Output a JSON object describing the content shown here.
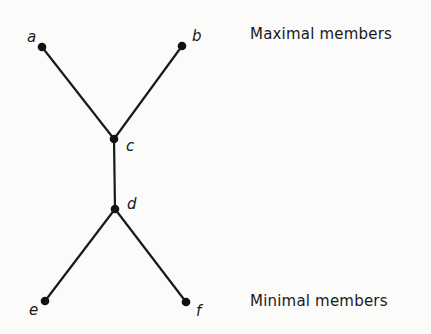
{
  "diagram": {
    "type": "hasse-diagram",
    "nodes": [
      {
        "id": "a",
        "label": "a",
        "x": 42,
        "y": 47,
        "lx": 27,
        "ly": 42
      },
      {
        "id": "b",
        "label": "b",
        "x": 182,
        "y": 46,
        "lx": 192,
        "ly": 41
      },
      {
        "id": "c",
        "label": "c",
        "x": 114,
        "y": 139,
        "lx": 126,
        "ly": 151
      },
      {
        "id": "d",
        "label": "d",
        "x": 115,
        "y": 209,
        "lx": 127,
        "ly": 209
      },
      {
        "id": "e",
        "label": "e",
        "x": 45,
        "y": 301,
        "lx": 29,
        "ly": 315
      },
      {
        "id": "f",
        "label": "f",
        "x": 186,
        "y": 302,
        "lx": 196,
        "ly": 316
      }
    ],
    "edges": [
      [
        "a",
        "c"
      ],
      [
        "b",
        "c"
      ],
      [
        "c",
        "d"
      ],
      [
        "d",
        "e"
      ],
      [
        "d",
        "f"
      ]
    ],
    "colors": {
      "line": "#1a1a1a",
      "node": "#111111",
      "background": "#fbfbfa"
    }
  },
  "labels": {
    "maximal": "Maximal members",
    "minimal": "Minimal members"
  }
}
